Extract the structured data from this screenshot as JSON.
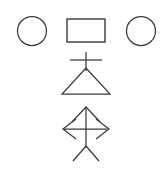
{
  "canvas": {
    "width": 163,
    "height": 169,
    "background_color": "#ffffff",
    "stroke_color": "#3a3a3a",
    "stroke_width": 1.25
  },
  "diagram": {
    "title": "",
    "shape_groups": [
      {
        "group_name": "top-row",
        "shapes": [
          {
            "name": "left-circle",
            "type": "circle",
            "cx": 32,
            "cy": 31,
            "r": 14.5
          },
          {
            "name": "center-rectangle",
            "type": "rectangle",
            "x": 67,
            "y": 19,
            "width": 38,
            "height": 23
          },
          {
            "name": "right-circle",
            "type": "circle",
            "cx": 141,
            "cy": 31,
            "r": 14.5
          }
        ]
      },
      {
        "group_name": "triangle-with-cross",
        "shapes": [
          {
            "name": "cross-vertical-stroke",
            "type": "line",
            "x1": 86,
            "y1": 52,
            "x2": 86,
            "y2": 71
          },
          {
            "name": "cross-horizontal-stroke",
            "type": "line",
            "x1": 70,
            "y1": 60,
            "x2": 102,
            "y2": 60
          },
          {
            "name": "triangle-outline",
            "type": "polygon",
            "points": "86,68 62,94 110,94 86,68"
          }
        ]
      },
      {
        "group_name": "four-way-arrow",
        "shapes": [
          {
            "name": "arrow-vertical-shaft",
            "type": "line",
            "x1": 86,
            "y1": 107,
            "x2": 86,
            "y2": 148
          },
          {
            "name": "arrow-horizontal-shaft",
            "type": "line",
            "x1": 64,
            "y1": 129,
            "x2": 107,
            "y2": 129
          },
          {
            "name": "arrowhead-up",
            "type": "polyline",
            "points": "72,122 86,107 100,122"
          },
          {
            "name": "arrowhead-right",
            "type": "polyline",
            "points": "96,119 109,129 96,139"
          },
          {
            "name": "arrowhead-left",
            "type": "polyline",
            "points": "76,119 63,129 76,139"
          },
          {
            "name": "arrowhead-down",
            "type": "polyline",
            "points": "73,161 86,146 99,161"
          }
        ]
      }
    ]
  }
}
